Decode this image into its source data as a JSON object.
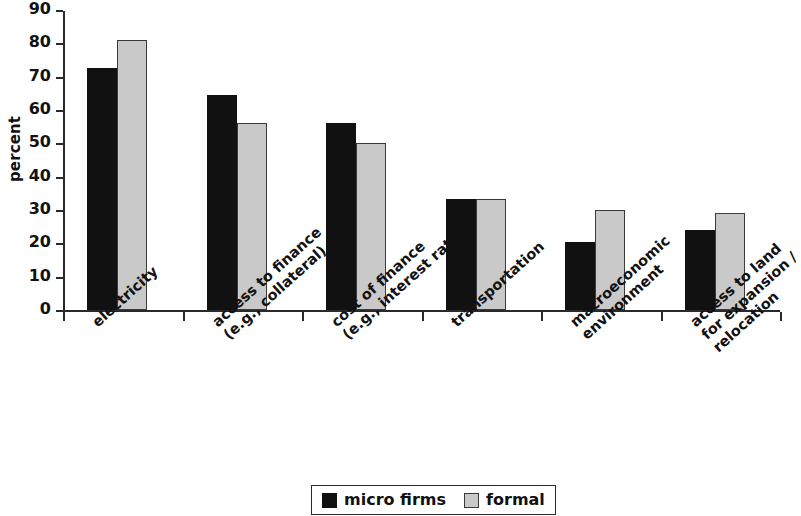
{
  "chart_data": {
    "type": "bar",
    "title": "",
    "subtitle": "",
    "xlabel": "",
    "ylabel": "percent",
    "ylim": [
      0,
      90
    ],
    "yticks": [
      0,
      10,
      20,
      30,
      40,
      50,
      60,
      70,
      80,
      90
    ],
    "ytick_labels": [
      "0",
      "10",
      "20",
      "30",
      "40",
      "50",
      "60",
      "70",
      "80",
      "90"
    ],
    "grid": false,
    "legend_position": "bottom-center",
    "categories": [
      "electricity",
      "access to finance\n(e.g., collateral)",
      "cost of finance\n(e.g., interest rates)",
      "transportation",
      "macroeconomic\nenvironment",
      "access to land\nfor expansion /\nrelocation"
    ],
    "series": [
      {
        "name": "micro firms",
        "color": "#111111",
        "values": [
          72.5,
          64.5,
          56.0,
          33.3,
          20.5,
          24.0
        ]
      },
      {
        "name": "formal",
        "color": "#c9c9c9",
        "values": [
          81.0,
          56.0,
          50.0,
          33.3,
          30.0,
          29.0
        ]
      }
    ]
  },
  "legend": {
    "entries": [
      {
        "label": "micro firms",
        "swatch": "micro"
      },
      {
        "label": "formal",
        "swatch": "formal"
      }
    ]
  }
}
